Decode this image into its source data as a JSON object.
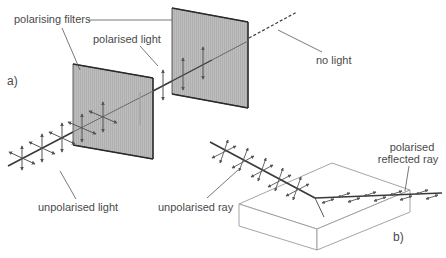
{
  "diagram": {
    "part_a": {
      "label": "a)",
      "filters_label": "polarising filters",
      "polarised_label": "polarised light",
      "no_light_label": "no light",
      "unpolarised_label": "unpolarised light"
    },
    "part_b": {
      "label": "b)",
      "unpolarised_ray_label": "unpolarised ray",
      "reflected_label_line1": "polarised",
      "reflected_label_line2": "reflected ray"
    },
    "colors": {
      "filter_fill": "#b8b8b8",
      "filter_edge": "#3a3a3a",
      "ray": "#3a3a3a",
      "arrow": "#555555",
      "leader": "#555555",
      "box_edge": "#9a9a9a",
      "text": "#4a4a4a"
    }
  }
}
